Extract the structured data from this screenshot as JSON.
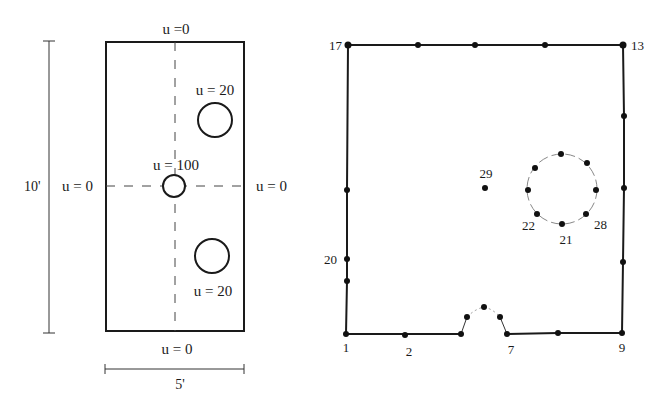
{
  "left_panel": {
    "labels": {
      "top_bc": "u =0",
      "left_bc": "u = 0",
      "right_bc": "u = 0",
      "bottom_bc": "u = 0",
      "upper_hole": "u = 20",
      "center_hole": "u = 100",
      "lower_hole": "u = 20",
      "height_dim": "10'",
      "width_dim": "5'"
    },
    "rect": {
      "x": 106,
      "y": 42,
      "width": 138,
      "height": 289
    },
    "holes": [
      {
        "name": "upper-hole",
        "cx": 215,
        "cy": 120,
        "r": 17
      },
      {
        "name": "center-hole",
        "cx": 174,
        "cy": 186,
        "r": 11
      },
      {
        "name": "lower-hole",
        "cx": 212,
        "cy": 256,
        "r": 17
      }
    ]
  },
  "right_panel": {
    "node_labels": {
      "n1": "1",
      "n2": "2",
      "n7": "7",
      "n9": "9",
      "n13": "13",
      "n17": "17",
      "n20": "20",
      "n21": "21",
      "n22": "22",
      "n28": "28",
      "n29": "29"
    },
    "boundary_nodes": [
      [
        346,
        334
      ],
      [
        405,
        335
      ],
      [
        461,
        334
      ],
      [
        467,
        317
      ],
      [
        484,
        307
      ],
      [
        500,
        317
      ],
      [
        507,
        334
      ],
      [
        558,
        333
      ],
      [
        622,
        333
      ],
      [
        623,
        262
      ],
      [
        624,
        188
      ],
      [
        624,
        116
      ],
      [
        623,
        45
      ],
      [
        545,
        45
      ],
      [
        475,
        45
      ],
      [
        418,
        45
      ],
      [
        348,
        45
      ],
      [
        347,
        190
      ],
      [
        347,
        259
      ],
      [
        347,
        281
      ]
    ],
    "hole_nodes": [
      [
        561,
        154
      ],
      [
        587,
        163
      ],
      [
        596,
        190
      ],
      [
        586,
        214
      ],
      [
        562,
        224
      ],
      [
        537,
        214
      ],
      [
        528,
        190
      ],
      [
        535,
        168
      ]
    ],
    "interior_node": [
      485,
      188
    ]
  }
}
